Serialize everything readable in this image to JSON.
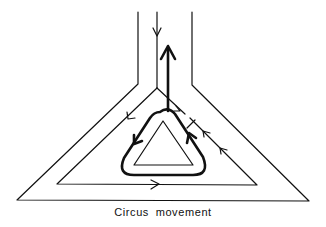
{
  "diagram": {
    "caption": "Circus movement",
    "colors": {
      "stroke": "#111111",
      "background": "#ffffff"
    },
    "elements": {
      "outer_conduit": "Y-shaped conduction pathway outline",
      "middle_pathway": "inner conduction line with branching",
      "central_obstacle": "small inner triangle (inexcitable core)",
      "reentry_loop": "thick rounded loop circulating around obstacle",
      "exit_arrow": "thick upward arrow leaving the loop",
      "entry_arrow": "thin downward arrow entering stalk",
      "block_marker": "perpendicular bar indicating unidirectional block",
      "flow_arrows": [
        "left-limb-down",
        "base-right",
        "right-limb-up-1",
        "right-limb-up-2",
        "right-branch-down"
      ]
    }
  }
}
